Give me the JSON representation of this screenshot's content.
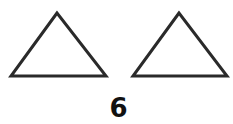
{
  "figure": {
    "shapes": [
      {
        "type": "triangle",
        "points": [
          [
            57,
            13
          ],
          [
            11,
            76
          ],
          [
            106,
            76
          ]
        ],
        "stroke": "#2a2a2a",
        "fill": "#ffffff"
      },
      {
        "type": "triangle",
        "points": [
          [
            179,
            13
          ],
          [
            133,
            76
          ],
          [
            227,
            76
          ]
        ],
        "stroke": "#2a2a2a",
        "fill": "#ffffff"
      }
    ],
    "label": "6"
  }
}
